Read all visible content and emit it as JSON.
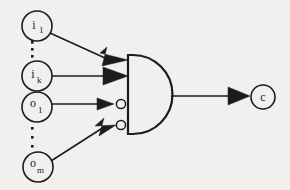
{
  "figure": {
    "background_color": "#f1f0ee",
    "ink_color": "#1c1c1c"
  },
  "gate": {
    "name": "and-gate",
    "type": "AND",
    "inverted_inputs": 2,
    "total_inputs": 4
  },
  "inputs": [
    {
      "id": "i1",
      "base": "i",
      "subscript": "1",
      "inverted": false,
      "cx": 37,
      "cy": 26,
      "r": 15
    },
    {
      "id": "ik",
      "base": "i",
      "subscript": "k",
      "inverted": false,
      "cx": 37,
      "cy": 76,
      "r": 15
    },
    {
      "id": "o1",
      "base": "o",
      "subscript": "1",
      "inverted": true,
      "cx": 37,
      "cy": 107,
      "r": 15
    },
    {
      "id": "om",
      "base": "o",
      "subscript": "m",
      "inverted": true,
      "cx": 38,
      "cy": 167,
      "r": 15
    }
  ],
  "output": {
    "id": "c",
    "base": "c",
    "subscript": "",
    "cx": 263,
    "cy": 97,
    "r": 12
  },
  "ellipses": [
    {
      "name": "ellipsis-upper",
      "x": 32,
      "ys": [
        42,
        49,
        56
      ]
    },
    {
      "name": "ellipsis-lower",
      "x": 32,
      "ys": [
        128,
        137,
        146
      ]
    }
  ]
}
